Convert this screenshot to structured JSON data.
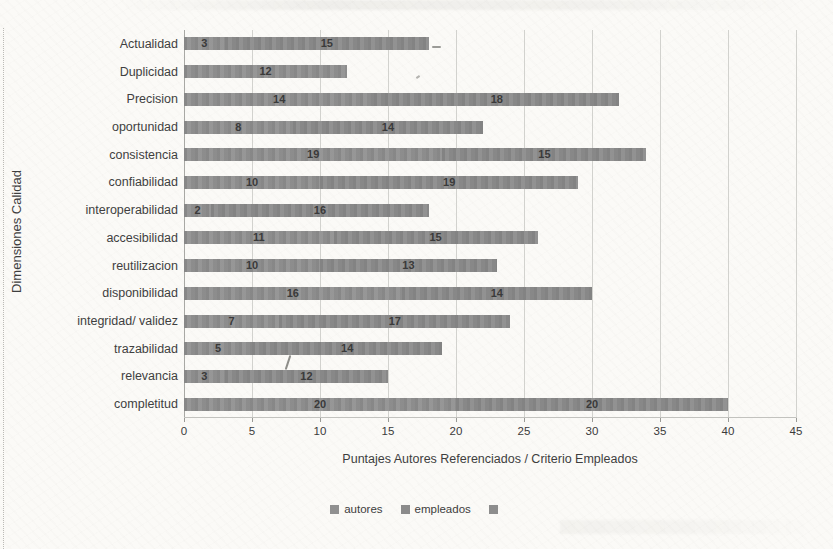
{
  "page": {
    "background_color": "#fbfaf7",
    "kind": "scanned book page with embedded Excel-style chart"
  },
  "chart_data": {
    "type": "bar",
    "orientation": "horizontal",
    "stacked": true,
    "categories": [
      "Actualidad",
      "Duplicidad",
      "Precision",
      "oportunidad",
      "consistencia",
      "confiabilidad",
      "interoperabilidad",
      "accesibilidad",
      "reutilizacion",
      "disponibilidad",
      "integridad/ validez",
      "trazabilidad",
      "relevancia",
      "completitud"
    ],
    "series": [
      {
        "name": "autores",
        "color": "#909090",
        "values": [
          3,
          12,
          14,
          8,
          19,
          10,
          2,
          11,
          10,
          16,
          7,
          5,
          3,
          20
        ]
      },
      {
        "name": "empleados",
        "color": "#8b8b8b",
        "values": [
          15,
          0,
          18,
          14,
          15,
          19,
          16,
          15,
          13,
          14,
          17,
          14,
          12,
          20
        ]
      }
    ],
    "totals": [
      18,
      12,
      32,
      22,
      34,
      29,
      18,
      26,
      23,
      30,
      24,
      19,
      15,
      40
    ],
    "xlabel": "Puntajes Autores Referenciados / Criterio Empleados",
    "ylabel": "Dimensiones Calidad",
    "xlim": [
      0,
      45
    ],
    "xticks": [
      0,
      5,
      10,
      15,
      20,
      25,
      30,
      35,
      40,
      45
    ],
    "grid": true,
    "bar_label_color": "#3a3a3a",
    "gridline_color": "#d2d2ce",
    "legend": {
      "position": "bottom",
      "items": [
        {
          "label": "autores",
          "color": "#909090"
        },
        {
          "label": "empleados",
          "color": "#8b8b8b"
        },
        {
          "label": "",
          "color": "#8d8d8d"
        }
      ]
    }
  }
}
